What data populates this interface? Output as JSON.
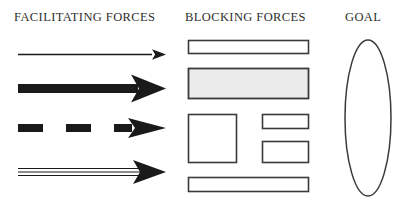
{
  "diagram": {
    "background_color": "#ffffff",
    "ink_color": "#1a1a1a",
    "outline_color": "#3a3a3a",
    "heading_color": "#2e2e2e",
    "shaded_fill_color": "#ebebeb"
  },
  "headings": {
    "facilitating": "FACILITATING FORCES",
    "blocking": "BLOCKING FORCES",
    "goal": "GOAL"
  },
  "facilitating_forces": {
    "label": "FACILITATING FORCES",
    "direction": "right",
    "count": 4,
    "arrows": [
      {
        "name": "thin-arrow",
        "style": "thin-solid-line",
        "description": "Thin solid line arrow pointing right",
        "shaft_thickness_px": 1,
        "length_px": 146,
        "weight": "weak"
      },
      {
        "name": "thick-arrow",
        "style": "thick-solid-bar",
        "description": "Heavy solid bar arrow pointing right",
        "shaft_thickness_px": 9,
        "length_px": 146,
        "weight": "strong"
      },
      {
        "name": "dashed-arrow",
        "style": "dashed-bar",
        "description": "Thick dashed arrow pointing right with two dashes",
        "shaft_thickness_px": 8,
        "dash_count": 2,
        "length_px": 146,
        "weight": "intermittent"
      },
      {
        "name": "triple-line-arrow",
        "style": "triple-parallel-lines",
        "description": "Three thin parallel lines forming one arrow pointing right",
        "line_count": 3,
        "length_px": 146,
        "weight": "compound"
      }
    ]
  },
  "blocking_forces": {
    "label": "BLOCKING FORCES",
    "count": 5,
    "rectangles": [
      {
        "name": "bar-top",
        "description": "Wide thin outlined bar",
        "fill": "none",
        "width_px": 121,
        "height_px": 14,
        "row": 1
      },
      {
        "name": "bar-shaded",
        "description": "Wide shaded block with light gray fill",
        "fill": "#ebebeb",
        "width_px": 121,
        "height_px": 31,
        "row": 2
      },
      {
        "name": "square-left",
        "description": "Large square block on the left",
        "fill": "none",
        "width_px": 49,
        "height_px": 49,
        "row": 3
      },
      {
        "name": "rect-right-upper",
        "description": "Small wide rectangle upper right",
        "fill": "none",
        "width_px": 46,
        "height_px": 15,
        "row": 3
      },
      {
        "name": "rect-right-lower",
        "description": "Small rectangle lower right",
        "fill": "none",
        "width_px": 46,
        "height_px": 21,
        "row": 3
      },
      {
        "name": "bar-bottom",
        "description": "Wide thin outlined bar at bottom",
        "fill": "none",
        "width_px": 121,
        "height_px": 14,
        "row": 4
      }
    ]
  },
  "goal": {
    "label": "GOAL",
    "shape": "ellipse",
    "fill": "none",
    "outline": "#3a3a3a",
    "center_x_px": 368,
    "center_y_px": 118,
    "radius_x_px": 23,
    "radius_y_px": 78
  }
}
